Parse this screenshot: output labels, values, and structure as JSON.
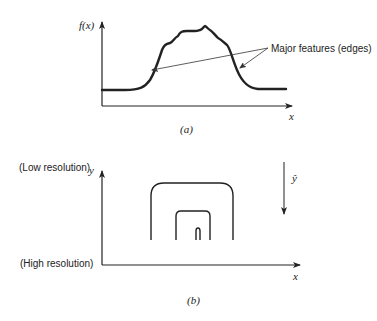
{
  "panel_a": {
    "y_axis_label": "f(x)",
    "x_axis_label": "x",
    "annotation": "Major features (edges)",
    "caption": "(a)"
  },
  "panel_b": {
    "y_axis_label": "y",
    "x_axis_label": "x",
    "top_label": "(Low resolution)",
    "bottom_label": "(High resolution)",
    "direction_label": "ŷ",
    "caption": "(b)"
  },
  "colors": {
    "stroke": "#222222",
    "background": "#ffffff"
  }
}
